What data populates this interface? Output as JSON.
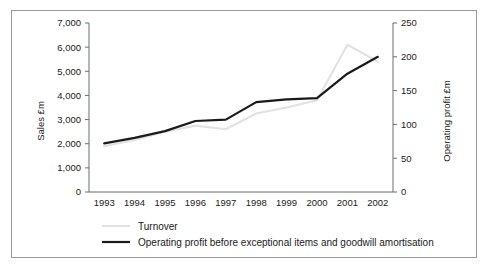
{
  "chart_data": {
    "type": "line",
    "title": "",
    "xlabel": "",
    "categories": [
      "1993",
      "1994",
      "1995",
      "1996",
      "1997",
      "1998",
      "1999",
      "2000",
      "2001",
      "2002"
    ],
    "grid": false,
    "legend_position": "bottom-left",
    "axes": {
      "left": {
        "label": "Sales £m",
        "ticks": [
          "0",
          "1,000",
          "2,000",
          "3,000",
          "4,000",
          "5,000",
          "6,000",
          "7,000"
        ],
        "tick_values": [
          0,
          1000,
          2000,
          3000,
          4000,
          5000,
          6000,
          7000
        ],
        "min": 0,
        "max": 7000,
        "step": 1000
      },
      "right": {
        "label": "Operating profit £m",
        "ticks": [
          "0",
          "50",
          "100",
          "150",
          "200",
          "250"
        ],
        "tick_values": [
          0,
          50,
          100,
          150,
          200,
          250
        ],
        "min": 0,
        "max": 250,
        "step": 50
      }
    },
    "series": [
      {
        "name": "Turnover",
        "axis": "left",
        "color": "#e2e2e2",
        "values": [
          1900,
          2150,
          2500,
          2750,
          2600,
          3250,
          3500,
          3800,
          6100,
          5400
        ]
      },
      {
        "name": "Operating profit before exceptional items and goodwill amortisation",
        "axis": "right",
        "color": "#1a1a1a",
        "values": [
          72,
          80,
          90,
          105,
          107,
          133,
          137,
          139,
          175,
          200
        ]
      }
    ]
  },
  "legend": {
    "items": [
      {
        "label": "Turnover",
        "color": "#e2e2e2"
      },
      {
        "label": "Operating profit before exceptional items and goodwill amortisation",
        "color": "#1a1a1a"
      }
    ]
  }
}
